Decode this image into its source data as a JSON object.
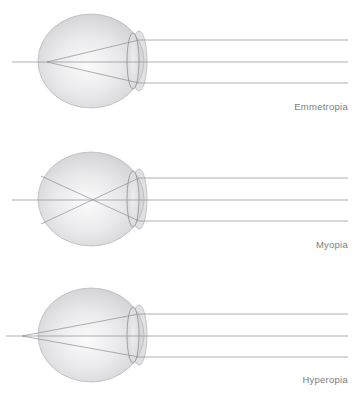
{
  "figure": {
    "background_color": "#ffffff",
    "clipped_header_text": "light rays focusing on the retina",
    "ray_color": "#8d8d96",
    "outline_color": "#9a9aa2",
    "sphere_fill_light": "#f2f2f2",
    "sphere_fill_mid": "#d8d8da",
    "sphere_fill_edge": "#b9b9bd",
    "caption_color": "#7d7d7d"
  },
  "diagrams": [
    {
      "id": "emmetropia",
      "caption": "Emmetropia",
      "description": "Parallel light rays are refracted by the cornea and lens and converge to a focal point precisely on the retina at the back of the eyeball.",
      "focal_point": {
        "x": 47,
        "y": 62
      },
      "focal_location": "on-retina",
      "eye": {
        "center_x": 91,
        "center_y": 61,
        "radius_x": 53,
        "radius_y": 47
      },
      "lens": {
        "center_x": 133,
        "center_y": 61,
        "radius_x": 6,
        "radius_y": 28
      },
      "cornea": {
        "center_x": 139,
        "center_y": 61,
        "radius_x": 8,
        "radius_y": 30
      },
      "rays": [
        {
          "y_in": 40,
          "label": "upper-ray"
        },
        {
          "y_in": 62,
          "label": "axial-ray"
        },
        {
          "y_in": 83,
          "label": "lower-ray"
        }
      ],
      "ray_start_x": 348,
      "axis_tail_x": 12
    },
    {
      "id": "myopia",
      "caption": "Myopia",
      "description": "The eyeball is too long, so parallel light rays converge to a focal point in front of the retina and then diverge again before reaching it.",
      "focal_point": {
        "x": 85,
        "y": 62
      },
      "focal_location": "in-front-of-retina",
      "eye": {
        "center_x": 91,
        "center_y": 61,
        "radius_x": 53,
        "radius_y": 47
      },
      "lens": {
        "center_x": 133,
        "center_y": 61,
        "radius_x": 6,
        "radius_y": 28
      },
      "cornea": {
        "center_x": 139,
        "center_y": 61,
        "radius_x": 8,
        "radius_y": 30
      },
      "rays": [
        {
          "y_in": 40,
          "label": "upper-ray"
        },
        {
          "y_in": 62,
          "label": "axial-ray"
        },
        {
          "y_in": 83,
          "label": "lower-ray"
        }
      ],
      "ray_start_x": 348,
      "axis_tail_x": 12
    },
    {
      "id": "hyperopia",
      "caption": "Hyperopia",
      "description": "The eyeball is too short, so parallel light rays have not yet converged when they reach the retina; the focal point falls behind the eye.",
      "focal_point": {
        "x": 22,
        "y": 58
      },
      "focal_location": "behind-retina",
      "eye": {
        "center_x": 91,
        "center_y": 57,
        "radius_x": 53,
        "radius_y": 47
      },
      "lens": {
        "center_x": 133,
        "center_y": 57,
        "radius_x": 6,
        "radius_y": 28
      },
      "cornea": {
        "center_x": 139,
        "center_y": 57,
        "radius_x": 8,
        "radius_y": 30
      },
      "rays": [
        {
          "y_in": 36,
          "label": "upper-ray"
        },
        {
          "y_in": 58,
          "label": "axial-ray"
        },
        {
          "y_in": 79,
          "label": "lower-ray"
        }
      ],
      "ray_start_x": 348,
      "axis_tail_x": 6
    }
  ]
}
